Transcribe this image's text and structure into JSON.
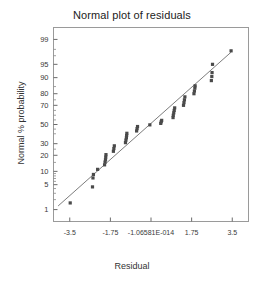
{
  "chart_data": {
    "type": "scatter",
    "title": "Normal plot of residuals",
    "xlabel": "Residual",
    "ylabel": "Normal % probability",
    "grid": false,
    "legend": null,
    "xlim": [
      -4.2,
      4.2
    ],
    "xticks": [
      "-3.5",
      "-1.75",
      "-1.06581E-014",
      "1.75",
      "3.5"
    ],
    "xtick_values": [
      -3.5,
      -1.75,
      0,
      1.75,
      3.5
    ],
    "yscale": "normal-probability",
    "ylim": [
      0.4,
      99.6
    ],
    "yticks": [
      "1",
      "5",
      "10",
      "20",
      "30",
      "50",
      "70",
      "80",
      "90",
      "95",
      "99"
    ],
    "ytick_values": [
      1,
      5,
      10,
      20,
      30,
      50,
      70,
      80,
      90,
      95,
      99
    ],
    "reference_line": {
      "x1": -4.0,
      "y1": 1.3,
      "x2": 3.45,
      "y2": 97.6
    },
    "marker": {
      "shape": "square",
      "color": "#4a4a4a",
      "size": 3.2
    },
    "points": [
      {
        "x": -3.48,
        "y": 1.6
      },
      {
        "x": -2.52,
        "y": 4.4
      },
      {
        "x": -2.5,
        "y": 7.2
      },
      {
        "x": -2.48,
        "y": 8.6
      },
      {
        "x": -2.3,
        "y": 11.0
      },
      {
        "x": -2.0,
        "y": 13.5
      },
      {
        "x": -1.98,
        "y": 15.2
      },
      {
        "x": -1.96,
        "y": 16.8
      },
      {
        "x": -1.95,
        "y": 18.6
      },
      {
        "x": -1.94,
        "y": 20.5
      },
      {
        "x": -1.62,
        "y": 23.2
      },
      {
        "x": -1.6,
        "y": 25.5
      },
      {
        "x": -1.58,
        "y": 28.0
      },
      {
        "x": -1.1,
        "y": 31.0
      },
      {
        "x": -1.08,
        "y": 33.5
      },
      {
        "x": -1.06,
        "y": 35.8
      },
      {
        "x": -1.05,
        "y": 38.2
      },
      {
        "x": -1.04,
        "y": 40.5
      },
      {
        "x": -0.62,
        "y": 43.0
      },
      {
        "x": -0.6,
        "y": 45.5
      },
      {
        "x": -0.58,
        "y": 47.8
      },
      {
        "x": -0.05,
        "y": 49.6
      },
      {
        "x": 0.42,
        "y": 51.2
      },
      {
        "x": 0.44,
        "y": 53.0
      },
      {
        "x": 0.46,
        "y": 54.5
      },
      {
        "x": 0.95,
        "y": 57.5
      },
      {
        "x": 0.96,
        "y": 60.0
      },
      {
        "x": 0.98,
        "y": 62.5
      },
      {
        "x": 1.0,
        "y": 65.0
      },
      {
        "x": 1.02,
        "y": 67.5
      },
      {
        "x": 1.4,
        "y": 70.0
      },
      {
        "x": 1.42,
        "y": 72.5
      },
      {
        "x": 1.44,
        "y": 75.0
      },
      {
        "x": 1.46,
        "y": 77.5
      },
      {
        "x": 1.85,
        "y": 80.0
      },
      {
        "x": 1.87,
        "y": 82.0
      },
      {
        "x": 1.89,
        "y": 84.0
      },
      {
        "x": 1.9,
        "y": 85.5
      },
      {
        "x": 2.6,
        "y": 88.5
      },
      {
        "x": 2.62,
        "y": 90.5
      },
      {
        "x": 2.63,
        "y": 92.2
      },
      {
        "x": 2.65,
        "y": 95.0
      },
      {
        "x": 3.45,
        "y": 97.8
      }
    ]
  }
}
